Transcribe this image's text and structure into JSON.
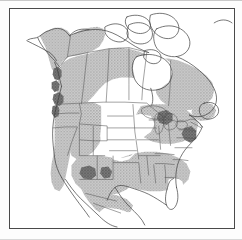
{
  "figure": {
    "kind": "range-distribution-map",
    "title": "North America species range map",
    "region": "North America",
    "frame": {
      "visible": true,
      "color": "#4a4a4a",
      "background": "#ffffff"
    }
  },
  "legend": {
    "visible": false,
    "entries": [
      {
        "key": "range-shaded",
        "label": "Range",
        "color": "#b3b3b3",
        "pattern": "gray stipple"
      },
      {
        "key": "range-dense",
        "label": "Concentrated range",
        "color": "#6f6f6f",
        "pattern": "dark stipple"
      },
      {
        "key": "no-range",
        "label": "Outside range",
        "color": "#ffffff",
        "pattern": "none"
      }
    ]
  },
  "colors": {
    "coastline": "#3b3b3b",
    "internal_border": "#555555",
    "range_fill": "#b4b4b4",
    "range_fill_dense": "#6d6d6d",
    "water": "#ffffff",
    "land_unshaded": "#ffffff",
    "frame": "#4a4a4a",
    "page": "#ffffff"
  },
  "map_features": {
    "shaded_regions": [
      "Alaska interior and south coast",
      "Yukon",
      "British Columbia",
      "Alberta",
      "Saskatchewan",
      "Manitoba",
      "Ontario",
      "Quebec",
      "Labrador and Newfoundland",
      "Maritime provinces",
      "Pacific Northwest",
      "California",
      "Great Basin",
      "Southwest United States",
      "Southeastern United States",
      "Gulf Coast",
      "Northern Mexico"
    ],
    "unshaded_regions": [
      "Canadian Arctic Archipelago",
      "Greenland edge",
      "Hudson Bay",
      "Northern Great Plains",
      "Central Great Plains",
      "Upper Midwest",
      "Florida peninsula",
      "Southern Mexico",
      "Gulf of Mexico",
      "Atlantic Ocean",
      "Pacific Ocean"
    ],
    "dense_patches": [
      "Coastal British Columbia",
      "Vancouver Island vicinity",
      "Washington Cascades",
      "Oregon coast",
      "Arizona highlands",
      "New Mexico highlands",
      "Lower Great Lakes",
      "Appalachian Atlantic coast"
    ]
  }
}
